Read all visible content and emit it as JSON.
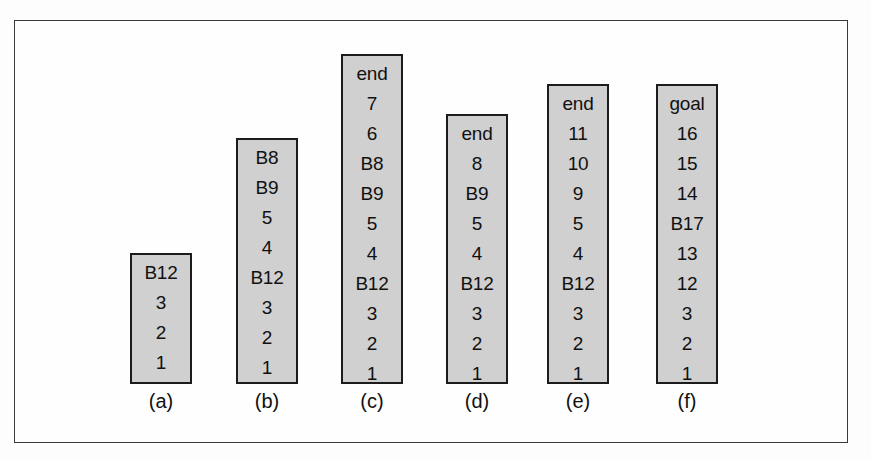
{
  "figure": {
    "type": "stack-diagram",
    "background_color": "#fdfdfd",
    "frame_border_color": "#3a3a3a",
    "bar_fill_color": "#d0d0d0",
    "bar_border_color": "#1c1c1c",
    "text_color": "#111111",
    "columns": [
      {
        "id": "a",
        "label": "(a)",
        "x": 129,
        "bottom_y": 383,
        "top_y": 252,
        "cells": [
          "B12",
          "3",
          "2",
          "1"
        ]
      },
      {
        "id": "b",
        "label": "(b)",
        "x": 235,
        "bottom_y": 383,
        "top_y": 137,
        "cells": [
          "B8",
          "B9",
          "5",
          "4",
          "B12",
          "3",
          "2",
          "1"
        ]
      },
      {
        "id": "c",
        "label": "(c)",
        "x": 340,
        "bottom_y": 383,
        "top_y": 53,
        "cells": [
          "end",
          "7",
          "6",
          "B8",
          "B9",
          "5",
          "4",
          "B12",
          "3",
          "2",
          "1"
        ]
      },
      {
        "id": "d",
        "label": "(d)",
        "x": 445,
        "bottom_y": 383,
        "top_y": 113,
        "cells": [
          "end",
          "8",
          "B9",
          "5",
          "4",
          "B12",
          "3",
          "2",
          "1"
        ]
      },
      {
        "id": "e",
        "label": "(e)",
        "x": 546,
        "bottom_y": 383,
        "top_y": 83,
        "cells": [
          "end",
          "11",
          "10",
          "9",
          "5",
          "4",
          "B12",
          "3",
          "2",
          "1"
        ]
      },
      {
        "id": "f",
        "label": "(f)",
        "x": 655,
        "bottom_y": 383,
        "top_y": 83,
        "cells": [
          "goal",
          "16",
          "15",
          "14",
          "B17",
          "13",
          "12",
          "3",
          "2",
          "1"
        ]
      }
    ]
  }
}
